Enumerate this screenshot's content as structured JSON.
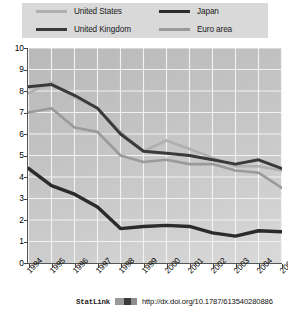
{
  "legend": {
    "items": [
      {
        "label": "United States",
        "color": "#b0b0b0",
        "width": 2.6
      },
      {
        "label": "Japan",
        "color": "#2b2b2b",
        "width": 3.4
      },
      {
        "label": "United Kingdom",
        "color": "#3a3a3a",
        "width": 3.0
      },
      {
        "label": "Euro area",
        "color": "#9a9a9a",
        "width": 2.6
      }
    ]
  },
  "footer": {
    "statlink_label": "StatLink",
    "url": "http://dx.doi.org/10.1787/613540280886"
  },
  "chart_data": {
    "type": "line",
    "title": "",
    "xlabel": "",
    "ylabel": "",
    "ylim": [
      0,
      10
    ],
    "yticks": [
      0,
      1,
      2,
      3,
      4,
      5,
      6,
      7,
      8,
      9,
      10
    ],
    "grid": true,
    "legend_position": "top",
    "categories": [
      "1994",
      "1995",
      "1996",
      "1997",
      "1998",
      "1999",
      "2000",
      "2001",
      "2002",
      "2003",
      "2004",
      "2005"
    ],
    "series": [
      {
        "name": "United States",
        "color": "#b0b0b0",
        "width": 2.6,
        "values": [
          7.9,
          8.4,
          7.7,
          7.2,
          6.1,
          5.2,
          5.7,
          5.3,
          4.9,
          4.5,
          4.5,
          4.3
        ]
      },
      {
        "name": "United Kingdom",
        "color": "#3a3a3a",
        "width": 3.0,
        "values": [
          8.2,
          8.3,
          7.8,
          7.2,
          6.0,
          5.2,
          5.1,
          5.0,
          4.8,
          4.6,
          4.8,
          4.4
        ]
      },
      {
        "name": "Japan",
        "color": "#2b2b2b",
        "width": 3.4,
        "values": [
          4.4,
          3.6,
          3.2,
          2.6,
          1.6,
          1.7,
          1.75,
          1.7,
          1.4,
          1.25,
          1.5,
          1.45
        ]
      },
      {
        "name": "Euro area",
        "color": "#9a9a9a",
        "width": 2.6,
        "values": [
          7.0,
          7.2,
          6.3,
          6.1,
          5.0,
          4.7,
          4.8,
          4.6,
          4.6,
          4.3,
          4.2,
          3.5
        ]
      }
    ]
  }
}
